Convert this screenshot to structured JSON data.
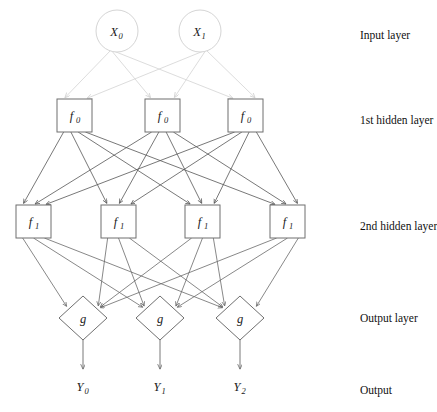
{
  "diagram": {
    "background_color": "#ffffff",
    "shape_stroke_color": "#6f6f6f",
    "shape_fill_color": "#ffffff",
    "input_edge_color": "#d8d8d8",
    "hidden_edge_color": "#555555",
    "output_edge_color": "#6a6a6a"
  },
  "layers": {
    "input": {
      "annotation": "Input layer",
      "shape": "circle",
      "nodes": [
        {
          "label": "X",
          "sub": "0",
          "cx": 117,
          "cy": 31,
          "r": 21
        },
        {
          "label": "X",
          "sub": "1",
          "cx": 200,
          "cy": 31,
          "r": 21
        }
      ]
    },
    "hidden1": {
      "annotation": "1st hidden layer",
      "shape": "square",
      "nodes": [
        {
          "label": "f",
          "sub": "0",
          "x": 57,
          "y": 99,
          "w": 35,
          "h": 33
        },
        {
          "label": "f",
          "sub": "0",
          "x": 145,
          "y": 99,
          "w": 35,
          "h": 33
        },
        {
          "label": "f",
          "sub": "0",
          "x": 228,
          "y": 99,
          "w": 35,
          "h": 33
        }
      ]
    },
    "hidden2": {
      "annotation": "2nd hidden layer",
      "shape": "square",
      "nodes": [
        {
          "label": "f",
          "sub": "1",
          "x": 16,
          "y": 205,
          "w": 35,
          "h": 33
        },
        {
          "label": "f",
          "sub": "1",
          "x": 101,
          "y": 205,
          "w": 35,
          "h": 33
        },
        {
          "label": "f",
          "sub": "1",
          "x": 185,
          "y": 205,
          "w": 35,
          "h": 33
        },
        {
          "label": "f",
          "sub": "1",
          "x": 270,
          "y": 205,
          "w": 35,
          "h": 33
        }
      ]
    },
    "output_layer": {
      "annotation": "Output layer",
      "shape": "diamond",
      "nodes": [
        {
          "label": "g",
          "sub": "",
          "cx": 83,
          "cy": 318,
          "rx": 24,
          "ry": 22
        },
        {
          "label": "g",
          "sub": "",
          "cx": 160,
          "cy": 318,
          "rx": 24,
          "ry": 22
        },
        {
          "label": "g",
          "sub": "",
          "cx": 240,
          "cy": 318,
          "rx": 24,
          "ry": 22
        }
      ]
    },
    "output": {
      "annotation": "Output",
      "nodes": [
        {
          "label": "Y",
          "sub": "0",
          "x": 83,
          "y": 386
        },
        {
          "label": "Y",
          "sub": "1",
          "x": 160,
          "y": 386
        },
        {
          "label": "Y",
          "sub": "2",
          "x": 240,
          "y": 386
        }
      ]
    }
  },
  "annotations": {
    "x": 360,
    "items": [
      {
        "text": "Input layer",
        "y": 35
      },
      {
        "text": "1st hidden layer",
        "y": 120
      },
      {
        "text": "2nd hidden layer",
        "y": 226
      },
      {
        "text": "Output layer",
        "y": 318
      },
      {
        "text": "Output",
        "y": 390
      }
    ]
  },
  "connections": {
    "input_to_hidden1": {
      "from_count": 2,
      "to_count": 3,
      "fully_connected": true
    },
    "hidden1_to_hidden2": {
      "from_count": 3,
      "to_count": 4,
      "fully_connected": true
    },
    "hidden2_to_output": {
      "from_count": 4,
      "to_count": 3,
      "fully_connected": true
    },
    "output_to_result": {
      "from_count": 3,
      "to_count": 3,
      "fully_connected": false
    }
  }
}
